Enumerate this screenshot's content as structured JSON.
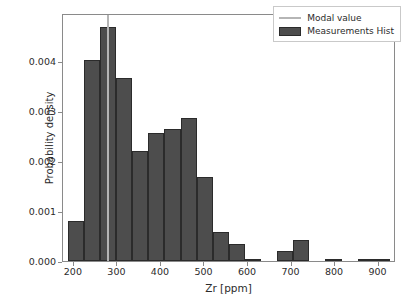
{
  "chart_data": {
    "type": "bar",
    "title": "",
    "subtitle": "",
    "xlabel": "Zr [ppm]",
    "ylabel": "Probability density",
    "xlim": [
      175,
      940
    ],
    "ylim": [
      0.0,
      0.00495
    ],
    "grid": false,
    "legend_position": "upper right",
    "bin_width": 37,
    "bin_edges": [
      186,
      223,
      260,
      297,
      334,
      371,
      408,
      445,
      482,
      519,
      556,
      593,
      630,
      667,
      704,
      741,
      778,
      815,
      852,
      889,
      926
    ],
    "categories": [
      "186-223",
      "223-260",
      "260-297",
      "297-334",
      "334-371",
      "371-408",
      "408-445",
      "445-482",
      "482-519",
      "519-556",
      "556-593",
      "593-630",
      "630-667",
      "667-704",
      "704-741",
      "741-778",
      "778-815",
      "815-852",
      "852-889",
      "889-926"
    ],
    "bin_centers": [
      204.5,
      241.5,
      278.5,
      315.5,
      352.5,
      389.5,
      426.5,
      463.5,
      500.5,
      537.5,
      574.5,
      611.5,
      648.5,
      685.5,
      722.5,
      759.5,
      796.5,
      833.5,
      870.5,
      907.5
    ],
    "values": [
      0.0008,
      0.00402,
      0.00468,
      0.00366,
      0.0022,
      0.00256,
      0.00264,
      0.00286,
      0.00168,
      0.00057,
      0.00034,
      4e-05,
      0.0,
      0.0002,
      0.00042,
      0.0,
      4e-05,
      0.0,
      4e-05,
      4e-05
    ],
    "series": [
      {
        "name": "Measurements Hist",
        "color": "#4d4d4d",
        "edge_color": "#2b2b2b",
        "values": [
          0.0008,
          0.00402,
          0.00468,
          0.00366,
          0.0022,
          0.00256,
          0.00264,
          0.00286,
          0.00168,
          0.00057,
          0.00034,
          4e-05,
          0.0,
          0.0002,
          0.00042,
          0.0,
          4e-05,
          0.0,
          4e-05,
          4e-05
        ]
      }
    ],
    "annotations": [
      {
        "name": "modal-value",
        "label": "Modal value",
        "type": "vline",
        "x": 278,
        "color": "#b5b5b5"
      }
    ],
    "xticks": [
      200,
      300,
      400,
      500,
      600,
      700,
      800,
      900
    ],
    "xtick_labels": [
      "200",
      "300",
      "400",
      "500",
      "600",
      "700",
      "800",
      "900"
    ],
    "yticks": [
      0.0,
      0.001,
      0.002,
      0.003,
      0.004
    ],
    "ytick_labels": [
      "0.000",
      "0.001",
      "0.002",
      "0.003",
      "0.004"
    ]
  },
  "legend": {
    "items": [
      {
        "label": "Modal value",
        "key": "line",
        "color": "#b5b5b5"
      },
      {
        "label": "Measurements Hist",
        "key": "patch",
        "color": "#4d4d4d"
      }
    ]
  },
  "colors": {
    "bar_fill": "#4d4d4d",
    "bar_edge": "#2b2b2b",
    "modal_line": "#b5b5b5",
    "axis": "#8a8a8a",
    "text": "#2b2b2b",
    "background": "#ffffff"
  }
}
